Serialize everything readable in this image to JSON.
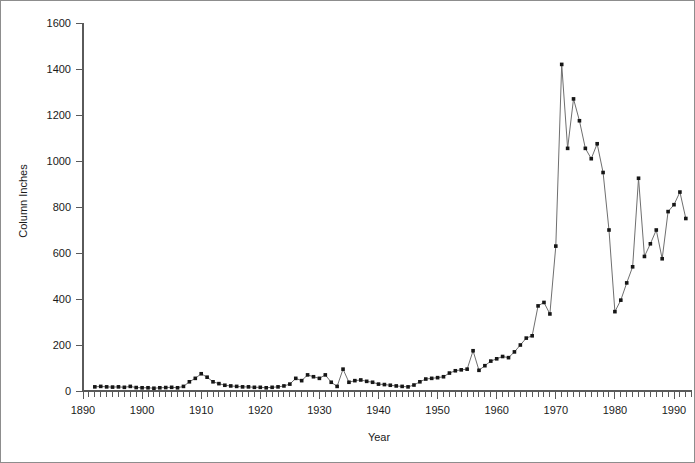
{
  "chart_data": {
    "type": "line",
    "title": "",
    "xlabel": "Year",
    "ylabel": "Column Inches",
    "xlim": [
      1890,
      1993
    ],
    "ylim": [
      0,
      1600
    ],
    "xticks": [
      1890,
      1900,
      1910,
      1920,
      1930,
      1940,
      1950,
      1960,
      1970,
      1980,
      1990
    ],
    "xtick_labels": [
      "1890",
      "1900",
      "1910",
      "1920",
      "1930",
      "1940",
      "1950",
      "1960",
      "1970",
      "1980",
      "1990"
    ],
    "yticks": [
      0,
      200,
      400,
      600,
      800,
      1000,
      1200,
      1400,
      1600
    ],
    "ytick_labels": [
      "0",
      "200",
      "400",
      "600",
      "800",
      "1000",
      "1200",
      "1400",
      "1600"
    ],
    "minor_xtick_interval": 1,
    "grid": false,
    "legend": false,
    "marker": "square",
    "x": [
      1892,
      1893,
      1894,
      1895,
      1896,
      1897,
      1898,
      1899,
      1900,
      1901,
      1902,
      1903,
      1904,
      1905,
      1906,
      1907,
      1908,
      1909,
      1910,
      1911,
      1912,
      1913,
      1914,
      1915,
      1916,
      1917,
      1918,
      1919,
      1920,
      1921,
      1922,
      1923,
      1924,
      1925,
      1926,
      1927,
      1928,
      1929,
      1930,
      1931,
      1932,
      1933,
      1934,
      1935,
      1936,
      1937,
      1938,
      1939,
      1940,
      1941,
      1942,
      1943,
      1944,
      1945,
      1946,
      1947,
      1948,
      1949,
      1950,
      1951,
      1952,
      1953,
      1954,
      1955,
      1956,
      1957,
      1958,
      1959,
      1960,
      1961,
      1962,
      1963,
      1964,
      1965,
      1966,
      1967,
      1968,
      1969,
      1970,
      1971,
      1972,
      1973,
      1974,
      1975,
      1976,
      1977,
      1978,
      1979,
      1980,
      1981,
      1982,
      1983,
      1984,
      1985,
      1986,
      1987,
      1988,
      1989,
      1990,
      1991,
      1992
    ],
    "y": [
      18,
      20,
      18,
      17,
      18,
      16,
      20,
      15,
      14,
      14,
      12,
      14,
      15,
      16,
      14,
      20,
      40,
      55,
      75,
      60,
      40,
      32,
      25,
      22,
      20,
      18,
      18,
      16,
      16,
      14,
      16,
      18,
      22,
      30,
      55,
      45,
      70,
      62,
      55,
      70,
      38,
      20,
      95,
      38,
      45,
      48,
      42,
      38,
      30,
      28,
      25,
      22,
      20,
      18,
      26,
      40,
      52,
      55,
      58,
      62,
      78,
      88,
      92,
      95,
      175,
      90,
      110,
      130,
      140,
      150,
      145,
      170,
      200,
      230,
      240,
      370,
      385,
      335,
      630,
      1420,
      1055,
      1270,
      1175,
      1055,
      1010,
      1075,
      950,
      700,
      345,
      395,
      470,
      540,
      925,
      585,
      640,
      700,
      575,
      780,
      810,
      865,
      750
    ],
    "series_name": "Column Inches"
  },
  "figure": {
    "background_color": "#ffffff",
    "line_color": "#6f6f6f",
    "marker_color": "#161616",
    "axis_color": "#5a5a5a",
    "border_color": "#8d8d8d"
  }
}
